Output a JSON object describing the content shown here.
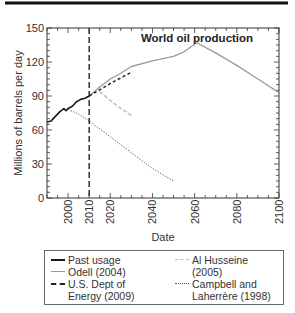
{
  "header": {
    "rule": true
  },
  "chart_data": {
    "type": "line",
    "title": "World oil production",
    "xlabel": "Date",
    "ylabel": "Millions of barrels per day",
    "xlim": [
      1990,
      2100
    ],
    "ylim": [
      0,
      150
    ],
    "xticks": [
      2000,
      2010,
      2020,
      2040,
      2060,
      2080,
      2100
    ],
    "yticks": [
      0,
      30,
      60,
      90,
      120,
      150
    ],
    "vline": {
      "x": 2010,
      "style": "dashed"
    },
    "grid": false,
    "legend_position": "below",
    "series": [
      {
        "name": "Past usage",
        "style": "solid-black",
        "color": "#1a1a1a",
        "x": [
          1990,
          1992,
          1994,
          1996,
          1998,
          1999,
          2000,
          2002,
          2004,
          2006,
          2008,
          2010
        ],
        "y": [
          67,
          68,
          72,
          76,
          79,
          77,
          79,
          81,
          85,
          87,
          88,
          90
        ]
      },
      {
        "name": "Odell (2004)",
        "style": "solid-gray",
        "color": "#9a9a9a",
        "x": [
          2010,
          2015,
          2020,
          2025,
          2030,
          2040,
          2050,
          2055,
          2061,
          2070,
          2080,
          2090,
          2100
        ],
        "y": [
          90,
          98,
          105,
          110,
          116,
          121,
          125,
          129,
          137,
          128,
          117,
          105,
          93
        ]
      },
      {
        "name": "U.S. Dept of Energy (2009)",
        "style": "dashed-black",
        "color": "#222222",
        "x": [
          2010,
          2020,
          2030
        ],
        "y": [
          90,
          101,
          111
        ]
      },
      {
        "name": "Al Husseine (2005)",
        "style": "dashed-lightgray",
        "color": "#bdbdbd",
        "x": [
          2015,
          2020,
          2025,
          2030
        ],
        "y": [
          94,
          86,
          79,
          73
        ]
      },
      {
        "name": "Campbell and Laherrère (1998)",
        "style": "dotted",
        "color": "#555555",
        "x": [
          2000,
          2005,
          2010,
          2020,
          2030,
          2040,
          2050
        ],
        "y": [
          78,
          74,
          68,
          54,
          40,
          26,
          15
        ]
      }
    ]
  },
  "legend": {
    "col1": [
      {
        "label": "Past usage"
      },
      {
        "label": "Odell (2004)"
      },
      {
        "label": "U.S. Dept of",
        "label2": "Energy (2009)"
      }
    ],
    "col2": [
      {
        "label": "Al Husseine",
        "label2": "(2005)"
      },
      {
        "label": "Campbell and",
        "label2": "Laherrère (1998)"
      }
    ]
  }
}
